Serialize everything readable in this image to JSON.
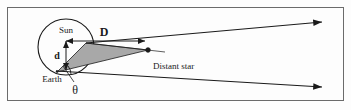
{
  "figure": {
    "border": {
      "visible": true,
      "color": "#6b6b6b",
      "x": 7,
      "y": 7,
      "width": 337,
      "height": 94
    },
    "background_color": "#fdfdfd",
    "stroke_color": "#1a1a1a",
    "shade_color": "#a8a8a8"
  },
  "labels": {
    "sun": "Sun",
    "earth": "Earth",
    "distant_star": "Distant star",
    "baseline_d": "d",
    "distance_D": "D",
    "angle_theta": "θ"
  },
  "geometry": {
    "orbit_circle": {
      "cx": 66,
      "cy": 47,
      "r": 28,
      "label": "earth-orbit-circle"
    },
    "sun_point": {
      "x": 66,
      "y": 40
    },
    "earth_point": {
      "x": 57,
      "y": 72
    },
    "star_point": {
      "x": 148,
      "y": 50
    },
    "arrow_upper_tip": {
      "x": 326,
      "y": 22
    },
    "arrow_lower_tip": {
      "x": 326,
      "y": 88
    },
    "d_arrow": {
      "x": 66,
      "y1": 40,
      "y2": 71,
      "orientation": "vertical",
      "double_headed": true
    },
    "D_arrow": {
      "x1": 66,
      "x2": 145,
      "y": 41,
      "orientation": "horizontal",
      "double_headed": true
    },
    "shaded_wedge_vertices": [
      [
        57,
        72
      ],
      [
        84,
        44
      ],
      [
        148,
        50
      ]
    ],
    "theta_leader": {
      "from": [
        72,
        83
      ],
      "to": [
        62,
        66
      ]
    }
  },
  "icons": {
    "star_marker": "filled-dot",
    "arrowheads": "solid-triangle"
  }
}
